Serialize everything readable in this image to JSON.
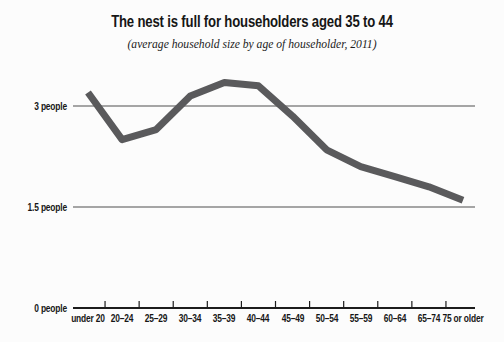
{
  "chart_data": {
    "type": "line",
    "title": "The nest is full for householders aged 35 to 44",
    "subtitle": "(average household size by age of householder, 2011)",
    "xlabel": "",
    "ylabel": "",
    "categories": [
      "under 20",
      "20–24",
      "25–29",
      "30–34",
      "35–39",
      "40–44",
      "45–49",
      "50–54",
      "55–59",
      "60–64",
      "65–74",
      "75 or older"
    ],
    "values": [
      3.2,
      2.5,
      2.65,
      3.15,
      3.35,
      3.3,
      2.85,
      2.35,
      2.1,
      1.95,
      1.8,
      1.6
    ],
    "series_name": "average household size",
    "y_ticks": [
      {
        "value": 3,
        "label": "3 people"
      },
      {
        "value": 1.5,
        "label": "1.5 people"
      },
      {
        "value": 0,
        "label": "0 people"
      }
    ],
    "ylim": [
      0,
      3.6
    ],
    "grid": "horizontal gridlines at labeled y ticks",
    "legend": "none",
    "line_color": "#5a5a5c",
    "grid_color": "#4e4e4e",
    "axis_color": "#1c1c1c",
    "text_color": "#161616",
    "background_color": "#fcfcfc"
  }
}
